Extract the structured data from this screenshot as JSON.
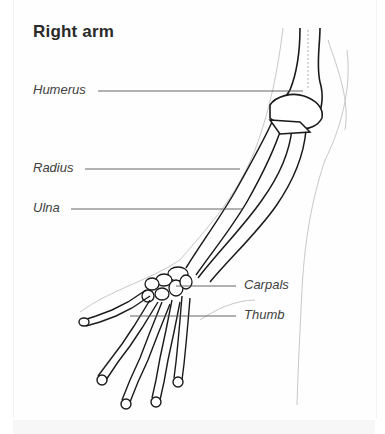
{
  "diagram": {
    "title": "Right arm",
    "labels": {
      "humerus": "Humerus",
      "radius": "Radius",
      "ulna": "Ulna",
      "carpals": "Carpals",
      "thumb": "Thumb"
    }
  }
}
